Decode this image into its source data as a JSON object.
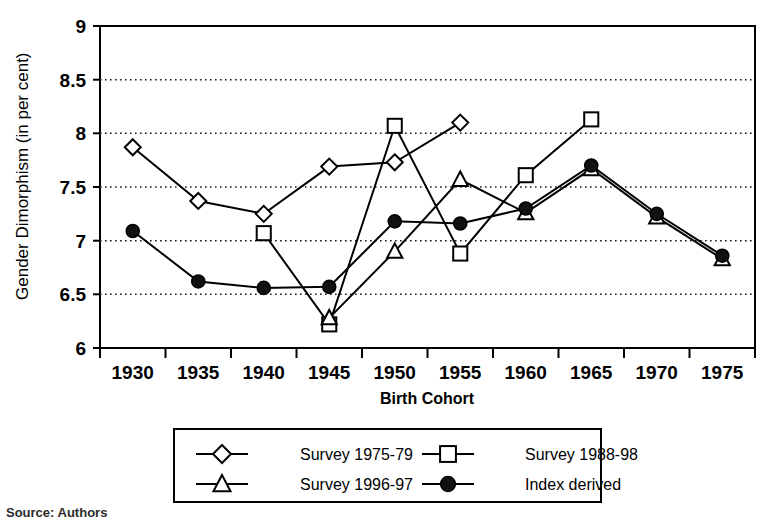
{
  "chart_data": {
    "type": "line",
    "title": "",
    "xlabel": "Birth Cohort",
    "ylabel": "Gender Dimorphism (in per cent)",
    "categories": [
      "1930",
      "1935",
      "1940",
      "1945",
      "1950",
      "1955",
      "1960",
      "1965",
      "1970",
      "1975"
    ],
    "ylim": [
      6,
      9
    ],
    "ytick_step": 0.5,
    "yticks": [
      "9",
      "8.5",
      "8",
      "7.5",
      "7",
      "6.5",
      "6"
    ],
    "grid": "horizontal-dotted",
    "legend_position": "bottom",
    "series": [
      {
        "name": "Survey 1975-79",
        "marker": "diamond-open",
        "values": [
          7.87,
          7.37,
          7.25,
          7.69,
          7.73,
          8.1,
          null,
          null,
          null,
          null
        ]
      },
      {
        "name": "Survey 1988-98",
        "marker": "square-open",
        "values": [
          null,
          null,
          7.07,
          6.22,
          8.07,
          6.88,
          7.61,
          8.13,
          null,
          null
        ]
      },
      {
        "name": "Survey 1996-97",
        "marker": "triangle-open",
        "values": [
          null,
          null,
          null,
          6.28,
          6.9,
          7.57,
          7.26,
          7.67,
          7.22,
          6.83
        ]
      },
      {
        "name": "Index derived",
        "marker": "circle-filled",
        "values": [
          7.09,
          6.62,
          6.56,
          6.57,
          7.18,
          7.16,
          7.3,
          7.7,
          7.25,
          6.86
        ]
      }
    ]
  },
  "axis": {
    "y_title": "Gender Dimorphism (in per cent)",
    "x_title": "Birth Cohort",
    "y_ticks": [
      "9",
      "8.5",
      "8",
      "7.5",
      "7",
      "6.5",
      "6"
    ],
    "x_ticks": [
      "1930",
      "1935",
      "1940",
      "1945",
      "1950",
      "1955",
      "1960",
      "1965",
      "1970",
      "1975"
    ]
  },
  "legend": {
    "entries": [
      {
        "label": "Survey 1975-79",
        "marker": "diamond-open"
      },
      {
        "label": "Survey 1988-98",
        "marker": "square-open"
      },
      {
        "label": "Survey 1996-97",
        "marker": "triangle-open"
      },
      {
        "label": "Index derived",
        "marker": "circle-filled"
      }
    ]
  },
  "colors": {
    "ink": "#000000",
    "grid": "#333333",
    "background": "#ffffff"
  },
  "caption": {
    "text": "Source: Authors"
  }
}
